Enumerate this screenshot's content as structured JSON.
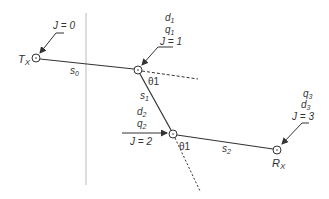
{
  "diagram": {
    "nodes": [
      {
        "id": "tx",
        "label": "T",
        "label_sub": "X",
        "x": 36,
        "y": 58,
        "annotation": [
          "J = 0"
        ]
      },
      {
        "id": "n1",
        "x": 138,
        "y": 70,
        "annotation": [
          "d1",
          "q1",
          "J = 1"
        ]
      },
      {
        "id": "n2",
        "x": 173,
        "y": 134,
        "annotation": [
          "d2",
          "q2",
          "J = 2"
        ]
      },
      {
        "id": "rx",
        "label": "R",
        "label_sub": "X",
        "x": 277,
        "y": 150,
        "annotation": [
          "q3",
          "d3",
          "J = 3"
        ]
      }
    ],
    "segments": [
      {
        "label": "s",
        "sub": "0"
      },
      {
        "label": "s",
        "sub": "1"
      },
      {
        "label": "s",
        "sub": "2"
      }
    ],
    "angles": [
      {
        "label": "θ1",
        "at": "n1"
      },
      {
        "label": "θ1",
        "at": "n2"
      }
    ],
    "labels": {
      "tx_main": "T",
      "tx_sub": "X",
      "rx_main": "R",
      "rx_sub": "X",
      "j0": "J = 0",
      "j1": "J = 1",
      "j2": "J = 2",
      "j3": "J = 3",
      "d1_main": "d",
      "d1_sub": "1",
      "q1_main": "q",
      "q1_sub": "1",
      "d2_main": "d",
      "d2_sub": "2",
      "q2_main": "q",
      "q2_sub": "2",
      "q3_main": "q",
      "q3_sub": "3",
      "d3_main": "d",
      "d3_sub": "3",
      "s0_main": "s",
      "s0_sub": "0",
      "s1_main": "s",
      "s1_sub": "1",
      "s2_main": "s",
      "s2_sub": "2",
      "theta1_a": "θ1",
      "theta1_b": "θ1"
    },
    "colors": {
      "line": "#333333",
      "divider": "#bbbbbb",
      "text": "#333333"
    }
  }
}
